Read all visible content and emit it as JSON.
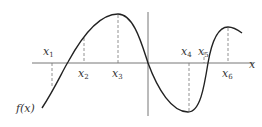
{
  "diagram": {
    "function_label": "f(x)",
    "axis_label": "x",
    "points": [
      {
        "name": "x",
        "sub": "1",
        "x": 52,
        "lx": 41,
        "ly": 55
      },
      {
        "name": "x",
        "sub": "2",
        "x": 84,
        "lx": 78,
        "ly": 77
      },
      {
        "name": "x",
        "sub": "3",
        "x": 118,
        "lx": 112,
        "ly": 77
      },
      {
        "name": "x",
        "sub": "4",
        "x": 189,
        "lx": 181,
        "ly": 55
      },
      {
        "name": "x",
        "sub": "5",
        "x": 204,
        "lx": 198,
        "ly": 55
      },
      {
        "name": "x",
        "sub": "6",
        "x": 228,
        "lx": 222,
        "ly": 77
      }
    ]
  }
}
